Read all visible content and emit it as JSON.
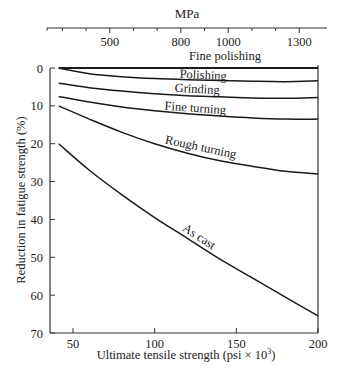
{
  "chart_data": {
    "type": "line",
    "title": "",
    "xlabel": "Ultimate tensile strength (psi × 10³)",
    "ylabel": "Reduction in fatigue strength (%)",
    "x2label": "MPa",
    "xlim": [
      40,
      200
    ],
    "ylim": [
      0,
      70
    ],
    "y_inverted": true,
    "grid": false,
    "xticks": [
      50,
      100,
      150,
      200
    ],
    "yticks": [
      0,
      10,
      20,
      30,
      40,
      50,
      60,
      70
    ],
    "x2ticks_labeled": [
      500,
      800,
      1000,
      1300
    ],
    "x2ticks_minor": [
      300,
      400,
      600,
      700,
      900,
      1100,
      1200
    ],
    "series": [
      {
        "name": "Fine polishing",
        "x": [
          40,
          80,
          120,
          160,
          200
        ],
        "y": [
          0,
          0,
          0,
          0,
          0
        ]
      },
      {
        "name": "Polishing",
        "x": [
          40,
          60,
          80,
          100,
          120,
          140,
          160,
          180,
          200
        ],
        "y": [
          0,
          1.5,
          2.3,
          2.8,
          3.1,
          3.3,
          3.5,
          3.6,
          3.4
        ]
      },
      {
        "name": "Grinding",
        "x": [
          40,
          60,
          80,
          100,
          120,
          140,
          160,
          180,
          200
        ],
        "y": [
          4,
          5.2,
          6.1,
          6.8,
          7.3,
          7.6,
          7.9,
          8.0,
          7.8
        ]
      },
      {
        "name": "Fine turning",
        "x": [
          40,
          60,
          80,
          100,
          120,
          140,
          160,
          180,
          200
        ],
        "y": [
          7.5,
          9.0,
          10.3,
          11.3,
          12.1,
          12.7,
          13.2,
          13.5,
          13.5
        ]
      },
      {
        "name": "Rough turning",
        "x": [
          40,
          60,
          80,
          100,
          120,
          140,
          160,
          180,
          200
        ],
        "y": [
          10,
          13.5,
          17,
          20,
          22.5,
          24.5,
          26,
          27.3,
          28
        ]
      },
      {
        "name": "As cast",
        "x": [
          40,
          60,
          80,
          100,
          120,
          140,
          160,
          180,
          200
        ],
        "y": [
          20,
          27,
          33.5,
          39.5,
          45,
          50.5,
          55.5,
          60.5,
          65.5
        ]
      }
    ],
    "annotations": [
      "Fine polishing",
      "Polishing",
      "Grinding",
      "Fine turning",
      "Rough turning",
      "As cast"
    ]
  },
  "labels": {
    "top_axis_title": "MPa",
    "x_title": "Ultimate tensile strength (psi × 10",
    "x_title_sup": "3",
    "x_title_end": ")",
    "y_title": "Reduction in fatigue strength (%)"
  }
}
